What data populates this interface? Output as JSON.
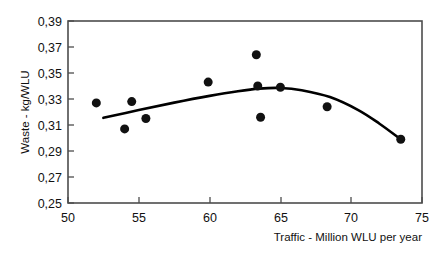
{
  "chart_data": {
    "type": "scatter",
    "title": "",
    "xlabel": "Traffic - Million  WLU per year",
    "ylabel": "Waste - kg/WLU",
    "xlim": [
      50,
      75
    ],
    "ylim": [
      0.25,
      0.39
    ],
    "xticks": [
      50,
      55,
      60,
      65,
      70,
      75
    ],
    "xtick_labels": [
      "50",
      "55",
      "60",
      "65",
      "70",
      "75"
    ],
    "yticks": [
      0.25,
      0.27,
      0.29,
      0.31,
      0.33,
      0.35,
      0.37,
      0.39
    ],
    "ytick_labels": [
      "0,25",
      "0,27",
      "0,29",
      "0,31",
      "0,33",
      "0,35",
      "0,37",
      "0,39"
    ],
    "grid": false,
    "legend": false,
    "decimal_separator": ",",
    "marker": {
      "shape": "circle",
      "color": "#111111",
      "size_px": 9
    },
    "series": [
      {
        "name": "Airport observations",
        "type": "scatter",
        "points": [
          {
            "x": 52.0,
            "y": 0.327
          },
          {
            "x": 54.0,
            "y": 0.307
          },
          {
            "x": 54.5,
            "y": 0.328
          },
          {
            "x": 55.5,
            "y": 0.315
          },
          {
            "x": 59.9,
            "y": 0.343
          },
          {
            "x": 63.3,
            "y": 0.364
          },
          {
            "x": 63.4,
            "y": 0.34
          },
          {
            "x": 63.6,
            "y": 0.316
          },
          {
            "x": 65.0,
            "y": 0.339
          },
          {
            "x": 68.3,
            "y": 0.324
          },
          {
            "x": 73.5,
            "y": 0.299
          }
        ]
      },
      {
        "name": "Fitted trend curve",
        "type": "line",
        "color": "#000000",
        "points": [
          {
            "x": 52.5,
            "y": 0.3155
          },
          {
            "x": 55.0,
            "y": 0.3215
          },
          {
            "x": 57.5,
            "y": 0.3272
          },
          {
            "x": 60.0,
            "y": 0.3324
          },
          {
            "x": 62.0,
            "y": 0.336
          },
          {
            "x": 63.5,
            "y": 0.338
          },
          {
            "x": 65.0,
            "y": 0.3385
          },
          {
            "x": 66.5,
            "y": 0.3368
          },
          {
            "x": 68.5,
            "y": 0.3315
          },
          {
            "x": 70.5,
            "y": 0.3215
          },
          {
            "x": 72.0,
            "y": 0.311
          },
          {
            "x": 73.5,
            "y": 0.299
          }
        ]
      }
    ]
  },
  "axes": {
    "x_title": "Traffic - Million  WLU per year",
    "y_title": "Waste - kg/WLU"
  },
  "ticks": {
    "x": [
      "50",
      "55",
      "60",
      "65",
      "70",
      "75"
    ],
    "y": [
      "0,39",
      "0,37",
      "0,35",
      "0,33",
      "0,31",
      "0,29",
      "0,27",
      "0,25"
    ]
  },
  "colors": {
    "frame": "#4d4d4d",
    "curve": "#000000",
    "marker": "#111111",
    "background": "#ffffff"
  }
}
